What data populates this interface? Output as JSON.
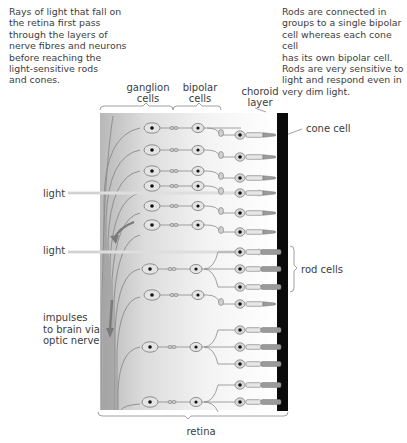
{
  "captions": {
    "left_note": [
      "Rays of light that fall on",
      "the retina first pass",
      "through the layers of",
      "nerve fibres and neurons",
      "before reaching the",
      "light-sensitive rods",
      "and cones."
    ],
    "right_note": [
      "Rods are connected in",
      "groups to a single bipolar",
      "cell whereas each cone cell",
      "has its own bipolar cell.",
      "Rods are very sensitive to",
      "light and respond even in",
      "very dim light."
    ]
  },
  "labels": {
    "ganglion": [
      "ganglion",
      "cells"
    ],
    "bipolar": [
      "bipolar",
      "cells"
    ],
    "choroid": [
      "choroid",
      "layer"
    ],
    "cone_cell": "cone cell",
    "light_1": "light",
    "light_2": "light",
    "rod_cells": "rod cells",
    "impulses": [
      "impulses",
      "to brain via",
      "optic nerve"
    ],
    "retina": "retina"
  },
  "colors": {
    "choroid": "#0a0a0a",
    "nerve": "#8a8a8a",
    "cell_fill": "#e4e4e4",
    "nucleus": "#111111",
    "light_ray": "#e8e8e8",
    "arrow": "#7a7a7a"
  }
}
